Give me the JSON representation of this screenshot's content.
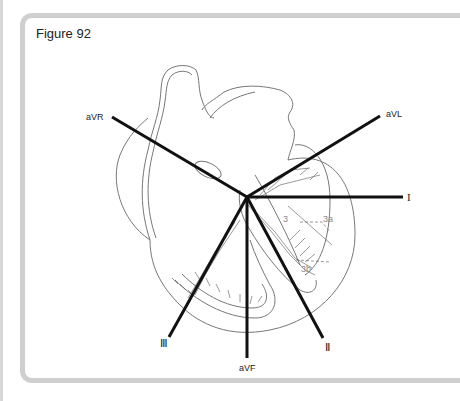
{
  "figure": {
    "title": "Figure 92"
  },
  "leads": {
    "aVR": "aVR",
    "aVL": "aVL",
    "I": "I",
    "II": "II",
    "III": "III",
    "aVF": "aVF"
  },
  "lead_glyphs": {
    "I": "I",
    "II": "Ⅱ",
    "III": "Ⅲ"
  },
  "conduction_labels": {
    "seg3": "3",
    "seg3a": "3a",
    "seg3b": "3b"
  },
  "colors": {
    "frame": "#cfcfcf",
    "lead_line": "#111111",
    "heart_outline": "#777777",
    "conduction": "#555555"
  }
}
